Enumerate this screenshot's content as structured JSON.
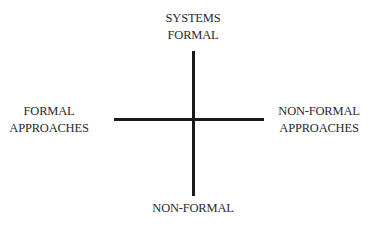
{
  "diagram": {
    "type": "quadrant-axes",
    "labels": {
      "top": [
        "SYSTEMS",
        "FORMAL"
      ],
      "left": [
        "FORMAL",
        "APPROACHES"
      ],
      "right": [
        "NON-FORMAL",
        "APPROACHES"
      ],
      "bottom": [
        "NON-FORMAL"
      ]
    },
    "colors": {
      "axis": "#1a1a1a",
      "text": "#2a2a2a",
      "background": "#ffffff"
    }
  }
}
